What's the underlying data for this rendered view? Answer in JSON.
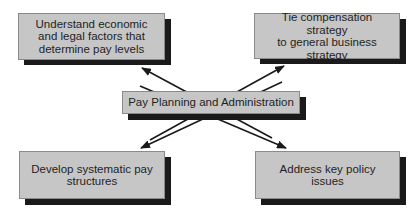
{
  "diagram": {
    "type": "hub-and-spoke",
    "center": {
      "label": "Pay Planning and Administration"
    },
    "nodes": [
      {
        "id": "top-left",
        "label": "Understand economic\nand legal factors that\ndetermine pay levels"
      },
      {
        "id": "top-right",
        "label": "Tie compensation strategy\nto general business\nstrategy"
      },
      {
        "id": "bottom-left",
        "label": "Develop systematic pay\nstructures"
      },
      {
        "id": "bottom-right",
        "label": "Address key policy\nissues"
      }
    ],
    "edges": [
      {
        "from": "center",
        "to": "top-left",
        "style": "arrow"
      },
      {
        "from": "center",
        "to": "top-right",
        "style": "arrow"
      },
      {
        "from": "center",
        "to": "bottom-left",
        "style": "arrow"
      },
      {
        "from": "center",
        "to": "bottom-right",
        "style": "arrow"
      }
    ],
    "colors": {
      "box_fill": "#c6c6c6",
      "box_border": "#8a8a8a",
      "shadow": "#1a1a1a",
      "arrow": "#1a1a1a",
      "text": "#1f1f1f",
      "background": "#ffffff"
    }
  }
}
